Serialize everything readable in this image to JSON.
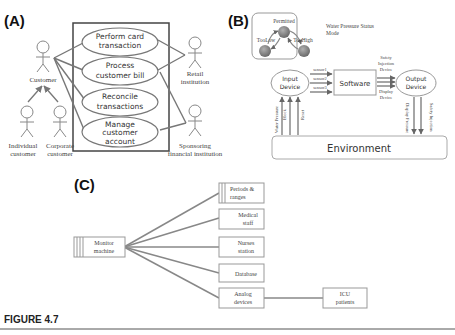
{
  "figure": {
    "caption": "FIGURE 4.7",
    "panels": {
      "A": {
        "label": "(A)",
        "use_cases": [
          "Perform card transaction",
          "Process customer bill",
          "Reconcile transactions",
          "Manage customer account"
        ],
        "use_case_lines": [
          [
            "Perform card",
            "transaction"
          ],
          [
            "Process",
            "customer bill"
          ],
          [
            "Reconcile",
            "transactions"
          ],
          [
            "Manage",
            "customer",
            "account"
          ]
        ],
        "actors": {
          "customer": "Customer",
          "individual": [
            "Individual",
            "customer"
          ],
          "corporate": [
            "Corporate",
            "customer"
          ],
          "retail": [
            "Retail",
            "institution"
          ],
          "sponsoring": [
            "Sponsoring",
            "financial institution"
          ]
        }
      },
      "B": {
        "label": "(B)",
        "states": {
          "permitted": "Permitted",
          "too_low": "TooLow",
          "too_high": "TooHigh"
        },
        "mode_caption": [
          "Water Pressure Status",
          "Mode"
        ],
        "input_device": [
          "Input",
          "Device"
        ],
        "software": "Software",
        "output_device": [
          "Output",
          "Device"
        ],
        "sensors": [
          "sensor1",
          "sensor2",
          "sensor3"
        ],
        "outputs_top": [
          "Safety",
          "Injection",
          "Device"
        ],
        "outputs_bottom": [
          "Display",
          "Device"
        ],
        "env_inputs": [
          "Water Pressure",
          "Block",
          "Reset"
        ],
        "env_outputs": [
          "Display Pressure",
          "Safety Injection"
        ],
        "environment": "Environment"
      },
      "C": {
        "label": "(C)",
        "source": [
          "Monitor",
          "machine"
        ],
        "targets": [
          [
            "Periods &",
            "ranges"
          ],
          [
            "Medical",
            "staff"
          ],
          [
            "Nurses",
            "station"
          ],
          [
            "Database"
          ],
          [
            "Analog",
            "devices"
          ]
        ],
        "downstream": [
          "ICU",
          "patients"
        ]
      }
    }
  }
}
